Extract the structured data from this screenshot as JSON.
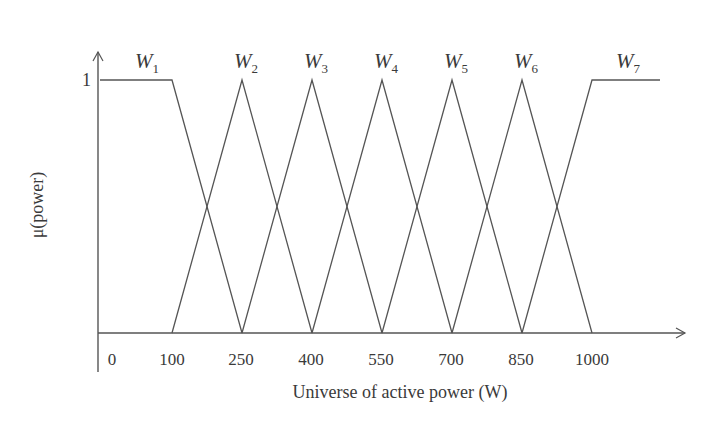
{
  "chart_data": {
    "type": "line",
    "title": "",
    "xlabel": "Universe of active power (W)",
    "ylabel": "μ(power)",
    "x_ticks": [
      "0",
      "100",
      "250",
      "400",
      "550",
      "700",
      "850",
      "1000"
    ],
    "y_ticks": [
      "1"
    ],
    "xlim": [
      0,
      1150
    ],
    "ylim": [
      0,
      1
    ],
    "grid": false,
    "legend": "inline labels above each membership function",
    "series": [
      {
        "name": "W1",
        "sub": "1",
        "points": [
          [
            0,
            1
          ],
          [
            100,
            1
          ],
          [
            250,
            0
          ]
        ]
      },
      {
        "name": "W2",
        "sub": "2",
        "points": [
          [
            100,
            0
          ],
          [
            250,
            1
          ],
          [
            400,
            0
          ]
        ]
      },
      {
        "name": "W3",
        "sub": "3",
        "points": [
          [
            250,
            0
          ],
          [
            400,
            1
          ],
          [
            550,
            0
          ]
        ]
      },
      {
        "name": "W4",
        "sub": "4",
        "points": [
          [
            400,
            0
          ],
          [
            550,
            1
          ],
          [
            700,
            0
          ]
        ]
      },
      {
        "name": "W5",
        "sub": "5",
        "points": [
          [
            550,
            0
          ],
          [
            700,
            1
          ],
          [
            850,
            0
          ]
        ]
      },
      {
        "name": "W6",
        "sub": "6",
        "points": [
          [
            700,
            0
          ],
          [
            850,
            1
          ],
          [
            1000,
            0
          ]
        ]
      },
      {
        "name": "W7",
        "sub": "7",
        "points": [
          [
            850,
            0
          ],
          [
            1000,
            1
          ],
          [
            1150,
            1
          ]
        ]
      }
    ]
  },
  "labels": {
    "xlabel": "Universe of active power (W)",
    "ylabel": "μ(power)",
    "y_one": "1"
  }
}
